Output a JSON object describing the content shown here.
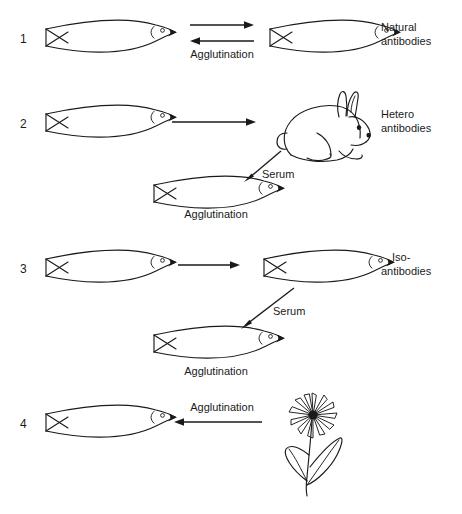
{
  "figure": {
    "background_color": "#ffffff",
    "ink_color": "#1a1a1a"
  },
  "rows": [
    {
      "number": "1",
      "left_subject": "fish",
      "right_subject": "fish",
      "arrow_type": "double",
      "arrow_label": "Agglutination",
      "result_label_line1": "Natural",
      "result_label_line2": "antibodies"
    },
    {
      "number": "2",
      "left_subject": "fish",
      "right_subject": "rabbit",
      "arrow_type": "single-right",
      "arrow_label": "",
      "result_label_line1": "Hetero",
      "result_label_line2": "antibodies",
      "serum_label": "Serum",
      "outcome_subject": "fish",
      "outcome_label": "Agglutination"
    },
    {
      "number": "3",
      "left_subject": "fish",
      "right_subject": "fish",
      "arrow_type": "single-right",
      "arrow_label": "",
      "result_label_line1": "Iso-",
      "result_label_line2": "antibodies",
      "serum_label": "Serum",
      "outcome_subject": "fish",
      "outcome_label": "Agglutination"
    },
    {
      "number": "4",
      "left_subject": "fish",
      "right_subject": "flower",
      "arrow_type": "single-left",
      "arrow_label": "Agglutination",
      "result_label_line1": "",
      "result_label_line2": ""
    }
  ],
  "icons": {
    "fish": "fish-icon",
    "rabbit": "rabbit-icon",
    "flower": "flower-icon",
    "arrow_right": "arrow-right-icon",
    "arrow_left": "arrow-left-icon",
    "arrow_diagonal": "arrow-diagonal-down-left-icon"
  }
}
